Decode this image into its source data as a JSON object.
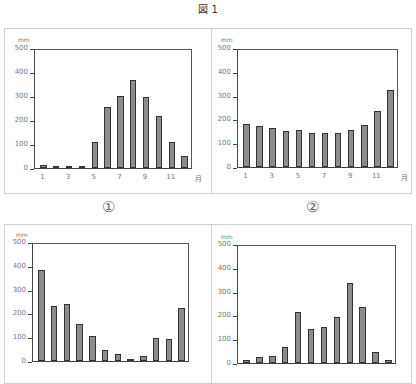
{
  "figure_title": "図 1",
  "captions": [
    "①",
    "②"
  ],
  "chart_data": [
    {
      "type": "bar",
      "id": "chart-1",
      "title": "",
      "ylabel": "mm",
      "xlabel": "月",
      "ylim": [
        0,
        500
      ],
      "yticks": [
        "500",
        "400",
        "300",
        "200",
        "100",
        "0"
      ],
      "categories": [
        "1",
        "2",
        "3",
        "4",
        "5",
        "6",
        "7",
        "8",
        "9",
        "10",
        "11",
        "12"
      ],
      "xtick_labels": [
        "1",
        "3",
        "5",
        "7",
        "9",
        "11"
      ],
      "values": [
        12,
        8,
        5,
        10,
        110,
        258,
        306,
        375,
        300,
        222,
        110,
        50
      ],
      "caption": "①"
    },
    {
      "type": "bar",
      "id": "chart-2",
      "title": "",
      "ylabel": "mm",
      "xlabel": "月",
      "ylim": [
        0,
        500
      ],
      "yticks": [
        "500",
        "400",
        "300",
        "200",
        "100",
        "0"
      ],
      "categories": [
        "1",
        "2",
        "3",
        "4",
        "5",
        "6",
        "7",
        "8",
        "9",
        "10",
        "11",
        "12"
      ],
      "xtick_labels": [
        "1",
        "3",
        "5",
        "7",
        "9",
        "11"
      ],
      "values": [
        182,
        175,
        168,
        152,
        158,
        145,
        145,
        145,
        158,
        180,
        238,
        330
      ],
      "caption": "②"
    },
    {
      "type": "bar",
      "id": "chart-3",
      "title": "",
      "ylabel": "mm",
      "xlabel": "",
      "ylim": [
        0,
        500
      ],
      "yticks": [
        "500",
        "400",
        "300",
        "200",
        "100",
        "0"
      ],
      "categories": [
        "1",
        "2",
        "3",
        "4",
        "5",
        "6",
        "7",
        "8",
        "9",
        "10",
        "11",
        "12"
      ],
      "values": [
        390,
        237,
        242,
        158,
        108,
        48,
        30,
        8,
        23,
        98,
        92,
        225
      ]
    },
    {
      "type": "bar",
      "id": "chart-4",
      "title": "",
      "ylabel": "mm",
      "xlabel": "",
      "ylim": [
        0,
        500
      ],
      "yticks": [
        "500",
        "400",
        "300",
        "200",
        "100",
        "0"
      ],
      "categories": [
        "1",
        "2",
        "3",
        "4",
        "5",
        "6",
        "7",
        "8",
        "9",
        "10",
        "11",
        "12"
      ],
      "values": [
        15,
        25,
        30,
        67,
        218,
        147,
        155,
        198,
        342,
        240,
        48,
        15
      ]
    }
  ],
  "colors": {
    "bar_fill": "#8c8c8c",
    "bar_border": "#333333",
    "axis": "#444444",
    "panel_border": "#cfcfcf"
  }
}
